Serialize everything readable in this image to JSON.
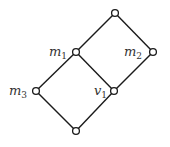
{
  "diagram": {
    "type": "hasse-diagram",
    "nodes": [
      {
        "id": "top",
        "x": 115,
        "y": 13,
        "label": "",
        "sub": ""
      },
      {
        "id": "m1",
        "x": 76,
        "y": 52,
        "label": "m",
        "sub": "1"
      },
      {
        "id": "m2",
        "x": 153,
        "y": 52,
        "label": "m",
        "sub": "2"
      },
      {
        "id": "m3",
        "x": 36,
        "y": 91,
        "label": "m",
        "sub": "3"
      },
      {
        "id": "v1",
        "x": 114,
        "y": 91,
        "label": "v",
        "sub": "1"
      },
      {
        "id": "bottom",
        "x": 76,
        "y": 131,
        "label": "",
        "sub": ""
      }
    ],
    "edges": [
      [
        "top",
        "m1"
      ],
      [
        "top",
        "m2"
      ],
      [
        "m1",
        "m3"
      ],
      [
        "m1",
        "v1"
      ],
      [
        "m2",
        "v1"
      ],
      [
        "m3",
        "bottom"
      ],
      [
        "v1",
        "bottom"
      ]
    ],
    "labels": {
      "m1": {
        "main": "m",
        "sub": "1"
      },
      "m2": {
        "main": "m",
        "sub": "2"
      },
      "m3": {
        "main": "m",
        "sub": "3"
      },
      "v1": {
        "main": "v",
        "sub": "1"
      }
    }
  }
}
